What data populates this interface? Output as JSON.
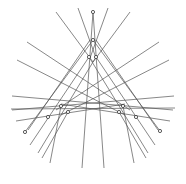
{
  "diagram": {
    "type": "line-arrangement",
    "symmetry": "3-fold",
    "colors": {
      "background": "#ffffff",
      "line": "#555555",
      "marker": "#333333"
    },
    "lines": [
      [
        93,
        12,
        82,
        168
      ],
      [
        93,
        12,
        104,
        168
      ],
      [
        56,
        12,
        93,
        62
      ],
      [
        78,
        8,
        96,
        58
      ],
      [
        130,
        12,
        93,
        62
      ],
      [
        108,
        8,
        90,
        58
      ],
      [
        27,
        42,
        130,
        110
      ],
      [
        17,
        60,
        125,
        115
      ],
      [
        159,
        42,
        56,
        110
      ],
      [
        169,
        60,
        61,
        115
      ],
      [
        12,
        96,
        173,
        110
      ],
      [
        174,
        96,
        12,
        110
      ],
      [
        11,
        109,
        175,
        108
      ],
      [
        16,
        121,
        125,
        104
      ],
      [
        170,
        121,
        61,
        104
      ],
      [
        93,
        40,
        25,
        132
      ],
      [
        93,
        40,
        160,
        131
      ],
      [
        89,
        57,
        30,
        145
      ],
      [
        96,
        57,
        155,
        145
      ],
      [
        96,
        57,
        38,
        153
      ],
      [
        89,
        57,
        148,
        153
      ],
      [
        61,
        106,
        50,
        163
      ],
      [
        123,
        106,
        134,
        163
      ],
      [
        68,
        112,
        42,
        158
      ],
      [
        119,
        112,
        146,
        158
      ],
      [
        90,
        40,
        28,
        130
      ],
      [
        96,
        40,
        158,
        130
      ]
    ],
    "markers": [
      [
        93,
        12
      ],
      [
        93,
        40
      ],
      [
        89,
        57
      ],
      [
        96,
        57
      ],
      [
        61,
        106
      ],
      [
        68,
        112
      ],
      [
        123,
        106
      ],
      [
        119,
        112
      ],
      [
        48,
        117
      ],
      [
        136,
        117
      ],
      [
        25,
        132
      ],
      [
        160,
        131
      ]
    ],
    "marker_radius": 1.6
  }
}
